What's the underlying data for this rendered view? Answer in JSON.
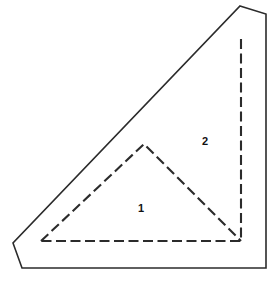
{
  "figure": {
    "background_color": "#ffffff",
    "width": 278,
    "height": 281,
    "outline": {
      "name": "outer-sheet-outline",
      "style": "solid",
      "stroke_color": "#2b2b2b",
      "stroke_width": 1.6,
      "fill_color": "#ffffff",
      "points": "240,6 266,14 266,268 22,268 13,243",
      "vertices": [
        {
          "label": "top-apex",
          "x": 240,
          "y": 6
        },
        {
          "label": "top-right-corner",
          "x": 266,
          "y": 14
        },
        {
          "label": "bottom-right-corner",
          "x": 266,
          "y": 268
        },
        {
          "label": "bottom-left-corner",
          "x": 22,
          "y": 268
        },
        {
          "label": "left-bevel-vertex",
          "x": 13,
          "y": 243
        }
      ]
    },
    "fold_triangle": {
      "name": "dashed-fold-triangle",
      "style": "dashed",
      "stroke_color": "#2b2b2b",
      "stroke_width": 2.1,
      "dash_pattern": "10 4.5",
      "points": "241,39 241,241 41,241",
      "vertices": [
        {
          "label": "fold-apex",
          "x": 241,
          "y": 39
        },
        {
          "label": "fold-bottom-right",
          "x": 241,
          "y": 241
        },
        {
          "label": "fold-bottom-left",
          "x": 41,
          "y": 241
        }
      ]
    },
    "fold_divider": {
      "name": "dashed-inner-divider",
      "style": "dashed",
      "stroke_color": "#2b2b2b",
      "stroke_width": 2.1,
      "dash_pattern": "10 4.5",
      "points": "41,241 144,144 241,241",
      "vertices": [
        {
          "label": "divider-left-foot",
          "x": 41,
          "y": 241
        },
        {
          "label": "divider-apex",
          "x": 144,
          "y": 144
        },
        {
          "label": "divider-right-foot",
          "x": 241,
          "y": 241
        }
      ]
    },
    "labels": [
      {
        "name": "region-label-1",
        "text": "1",
        "x": 141,
        "y": 209
      },
      {
        "name": "region-label-2",
        "text": "2",
        "x": 205,
        "y": 142
      }
    ]
  }
}
